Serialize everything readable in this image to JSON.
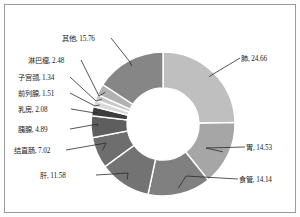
{
  "chart_data": {
    "type": "pie",
    "variant": "donut",
    "title": "",
    "subtitle": "",
    "xlabel": "",
    "ylabel": "",
    "legend": "none",
    "grid": false,
    "units": "%",
    "start_angle_deg": 0,
    "direction": "clockwise",
    "total": 100.0,
    "categories": [
      "肺",
      "胃",
      "食管",
      "肝",
      "结直肠",
      "胰腺",
      "乳房",
      "前列腺",
      "子宫颈",
      "淋巴瘤",
      "其他"
    ],
    "values": [
      24.66,
      14.53,
      14.14,
      11.58,
      7.02,
      4.89,
      2.08,
      1.51,
      1.34,
      2.48,
      15.76
    ],
    "colors": [
      "#bfbfbf",
      "#a6a6a6",
      "#808080",
      "#737373",
      "#6e6e6e",
      "#5e5e5e",
      "#3d3d3d",
      "#d9d9d9",
      "#c9c9c9",
      "#b2b2b2",
      "#868686"
    ],
    "slices": [
      {
        "name": "肺",
        "value": 24.66,
        "label": "肺, 24.66",
        "color": "#bfbfbf",
        "side": "right"
      },
      {
        "name": "胃",
        "value": 14.53,
        "label": "胃, 14.53",
        "color": "#a6a6a6",
        "side": "right"
      },
      {
        "name": "食管",
        "value": 14.14,
        "label": "食管, 14.14",
        "color": "#808080",
        "side": "right"
      },
      {
        "name": "肝",
        "value": 11.58,
        "label": "肝, 11.58",
        "color": "#737373",
        "side": "left"
      },
      {
        "name": "结直肠",
        "value": 7.02,
        "label": "结直肠, 7.02",
        "color": "#6e6e6e",
        "side": "left"
      },
      {
        "name": "胰腺",
        "value": 4.89,
        "label": "胰腺, 4.89",
        "color": "#5e5e5e",
        "side": "left"
      },
      {
        "name": "乳房",
        "value": 2.08,
        "label": "乳房, 2.08",
        "color": "#3d3d3d",
        "side": "left"
      },
      {
        "name": "前列腺",
        "value": 1.51,
        "label": "前列腺, 1.51",
        "color": "#d9d9d9",
        "side": "left"
      },
      {
        "name": "子宫颈",
        "value": 1.34,
        "label": "子宫颈, 1.34",
        "color": "#c9c9c9",
        "side": "left"
      },
      {
        "name": "淋巴瘤",
        "value": 2.48,
        "label": "淋巴瘤, 2.48",
        "color": "#b2b2b2",
        "side": "left"
      },
      {
        "name": "其他",
        "value": 15.76,
        "label": "其他, 15.76",
        "color": "#868686",
        "side": "left"
      }
    ]
  },
  "labels": {
    "lung": "肺, 24.66",
    "stomach": "胃, 14.53",
    "esophagus": "食管, 14.14",
    "liver": "肝, 11.58",
    "colorectal": "结直肠, 7.02",
    "pancreas": "胰腺, 4.89",
    "breast": "乳房, 2.08",
    "prostate": "前列腺, 1.51",
    "cervix": "子宫颈, 1.34",
    "lymphoma": "淋巴瘤, 2.48",
    "other": "其他, 15.76"
  },
  "style": {
    "border_color": "#9b9b9b",
    "background": "#ffffff",
    "slice_gap_color": "#ffffff",
    "leader_line_color": "#2b2b2b",
    "text_color": "#1a1a1a"
  }
}
